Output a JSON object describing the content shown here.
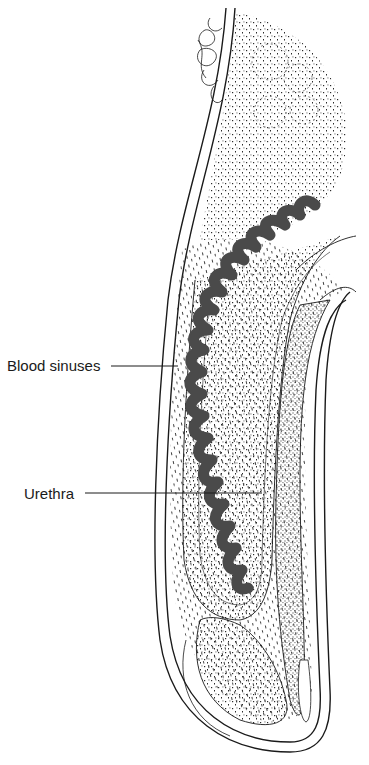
{
  "diagram": {
    "type": "anatomical-illustration",
    "labels": [
      {
        "id": "blood_sinuses",
        "text": "Blood sinuses",
        "anchor": [
          30,
          366
        ],
        "leader_to": [
          178,
          366
        ]
      },
      {
        "id": "urethra",
        "text": "Urethra",
        "anchor": [
          85,
          493
        ],
        "leader_to": [
          262,
          493
        ]
      }
    ],
    "colors": {
      "outline": "#1a1a1a",
      "sinus_fill": "#4a4a4a",
      "stipple": "#2b2b2b",
      "background": "#ffffff"
    }
  }
}
